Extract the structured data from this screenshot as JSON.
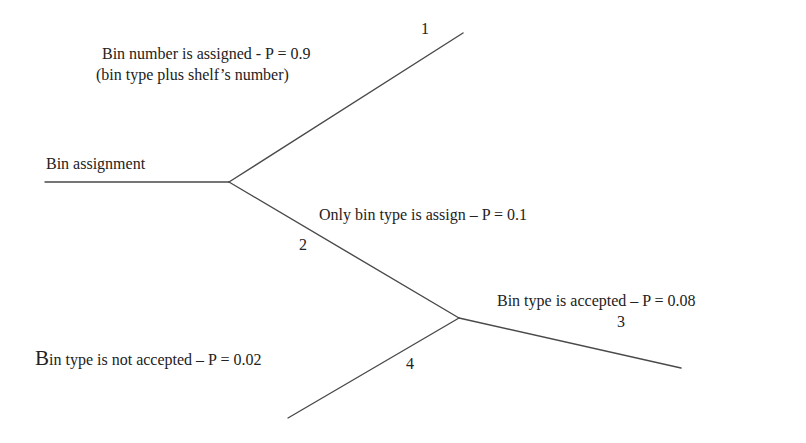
{
  "diagram": {
    "type": "event-tree",
    "root": {
      "label": "Bin assignment"
    },
    "branches": [
      {
        "id": 1,
        "number": "1",
        "label_line1": "Bin number is assigned - P = 0.9",
        "label_line2": "(bin type plus shelf’s number)",
        "probability": 0.9
      },
      {
        "id": 2,
        "number": "2",
        "label": "Only bin type is assign – P = 0.1",
        "probability": 0.1
      },
      {
        "id": 3,
        "number": "3",
        "label": "Bin type is accepted – P = 0.08",
        "probability": 0.08
      },
      {
        "id": 4,
        "number": "4",
        "label": "Bin type is not accepted – P = 0.02",
        "probability": 0.02
      }
    ],
    "line_color": "#4a4a4a",
    "text_color": "#222222"
  }
}
